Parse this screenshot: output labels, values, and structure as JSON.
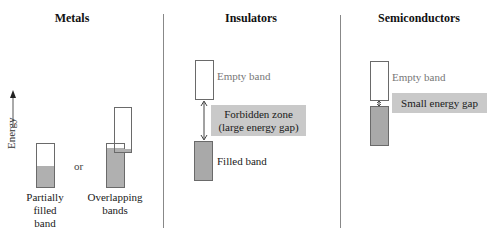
{
  "panels": [
    {
      "heading": "Metals",
      "axis_label": "Energy",
      "connector": "or",
      "bands": {
        "partially_filled_caption": [
          "Partially",
          "filled",
          "band"
        ],
        "overlapping_caption": [
          "Overlapping",
          "bands"
        ]
      }
    },
    {
      "heading": "Insulators",
      "empty_band_label": "Empty band",
      "gap_label": [
        "Forbidden zone",
        "(large energy gap)"
      ],
      "filled_band_label": "Filled band"
    },
    {
      "heading": "Semiconductors",
      "empty_band_label": "Empty band",
      "gap_label": "Small energy gap"
    }
  ],
  "colors": {
    "band_border": "#6a6a6a",
    "band_fill": "#a9a9a9",
    "gap_box": "#c9c9c9",
    "divider": "#888888",
    "gray_label": "#777777"
  }
}
